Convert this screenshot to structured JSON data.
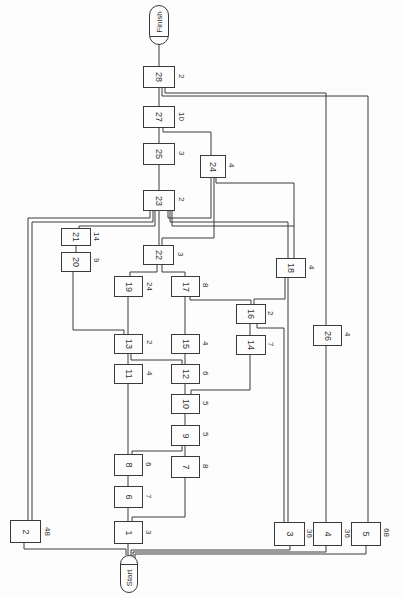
{
  "diagram": {
    "type": "activity-network",
    "orientation": "rotated-90",
    "terminals": {
      "start": {
        "label": "Start"
      },
      "finish": {
        "label": "Finish"
      }
    },
    "nodes": [
      {
        "id": "1",
        "duration": "3"
      },
      {
        "id": "2",
        "duration": "48"
      },
      {
        "id": "3",
        "duration": "36"
      },
      {
        "id": "4",
        "duration": "36"
      },
      {
        "id": "5",
        "duration": "68"
      },
      {
        "id": "6",
        "duration": "7"
      },
      {
        "id": "7",
        "duration": "8"
      },
      {
        "id": "8",
        "duration": "6"
      },
      {
        "id": "9",
        "duration": "5"
      },
      {
        "id": "10",
        "duration": "5"
      },
      {
        "id": "11",
        "duration": "4"
      },
      {
        "id": "12",
        "duration": "6"
      },
      {
        "id": "13",
        "duration": "2"
      },
      {
        "id": "14",
        "duration": "7"
      },
      {
        "id": "15",
        "duration": "4"
      },
      {
        "id": "16",
        "duration": "2"
      },
      {
        "id": "17",
        "duration": "8"
      },
      {
        "id": "18",
        "duration": "4"
      },
      {
        "id": "19",
        "duration": "24"
      },
      {
        "id": "20",
        "duration": "9"
      },
      {
        "id": "21",
        "duration": "14"
      },
      {
        "id": "22",
        "duration": "3"
      },
      {
        "id": "23",
        "duration": "2"
      },
      {
        "id": "24",
        "duration": "4"
      },
      {
        "id": "25",
        "duration": "3"
      },
      {
        "id": "26",
        "duration": "4"
      },
      {
        "id": "27",
        "duration": "10"
      },
      {
        "id": "28",
        "duration": "2"
      }
    ]
  }
}
